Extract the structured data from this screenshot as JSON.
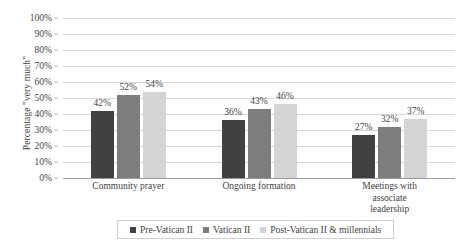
{
  "chart_data": {
    "type": "bar",
    "title": "",
    "xlabel": "",
    "ylabel": "Percentage \"very much\"",
    "ylim": [
      0,
      100
    ],
    "ytick_labels": [
      "100%",
      "90%",
      "80%",
      "70%",
      "60%",
      "50%",
      "40%",
      "30%",
      "20%",
      "10%",
      "0%"
    ],
    "ytick_values": [
      100,
      90,
      80,
      70,
      60,
      50,
      40,
      30,
      20,
      10,
      0
    ],
    "grid": true,
    "legend_position": "bottom",
    "categories": [
      "Community prayer",
      "Ongoing formation",
      "Meetings with associate leadership"
    ],
    "category_lines": [
      [
        "Community prayer"
      ],
      [
        "Ongoing formation"
      ],
      [
        "Meetings with associate",
        "leadership"
      ]
    ],
    "series": [
      {
        "name": "Pre-Vatican II",
        "color": "#414141",
        "values": [
          42,
          36,
          27
        ],
        "labels": [
          "42%",
          "36%",
          "27%"
        ]
      },
      {
        "name": "Vatican II",
        "color": "#7d7d7d",
        "values": [
          52,
          43,
          32
        ],
        "labels": [
          "52%",
          "43%",
          "32%"
        ]
      },
      {
        "name": "Post-Vatican II & millennials",
        "color": "#d4d4d4",
        "values": [
          54,
          46,
          37
        ],
        "labels": [
          "54%",
          "46%",
          "37%"
        ]
      }
    ]
  },
  "colors": {
    "background": "#ffffff",
    "text": "#3f3f3f",
    "gridline": "#d6d6d6",
    "axis": "#9a9a9a",
    "legend_border": "#cfcfcf"
  }
}
